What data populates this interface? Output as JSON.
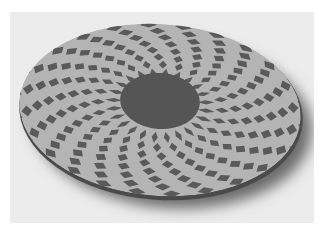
{
  "photo": {
    "subject": "segmented wooden platter with radial checkered diamond pattern",
    "alt": "Turned wooden plate with light and dark checkerboard rosette pattern and a dark solid center",
    "colors": {
      "background": "#ececec",
      "light_tile": "#b4b4b4",
      "dark_tile": "#5a5a5a",
      "center": "#555555",
      "rim": "#4a4a4a",
      "shadow": "#6a6a6a"
    },
    "pattern": {
      "rings": 9,
      "segments": 48
    }
  }
}
